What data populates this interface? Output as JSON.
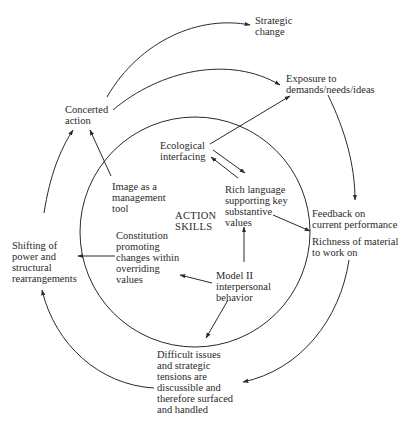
{
  "diagram": {
    "center_label": "ACTION\nSKILLS",
    "nodes": {
      "strategic_change": "Strategic\nchange",
      "exposure": "Exposure to\ndemands/needs/ideas",
      "concerted_action": "Concerted\naction",
      "ecological_interfacing": "Ecological\ninterfacing",
      "image_tool": "Image as a\nmanagement\ntool",
      "rich_language": "Rich language\nsupporting key\nsubstantive\nvalues",
      "feedback": "Feedback on\ncurrent performance",
      "richness": "Richness of material\nto work on",
      "shifting_power": "Shifting of\npower and\nstructural\nrearrangements",
      "constitution": "Constitution\npromoting\nchanges within\noverriding\nvalues",
      "model_ii": "Model II\ninterpersonal\nbehavior",
      "difficult_issues": "Difficult issues\nand strategic\ntensions are\ndiscussible and\ntherefore surfaced\nand handled"
    },
    "colors": {
      "line": "#2a2a2a",
      "background": "#ffffff"
    }
  }
}
